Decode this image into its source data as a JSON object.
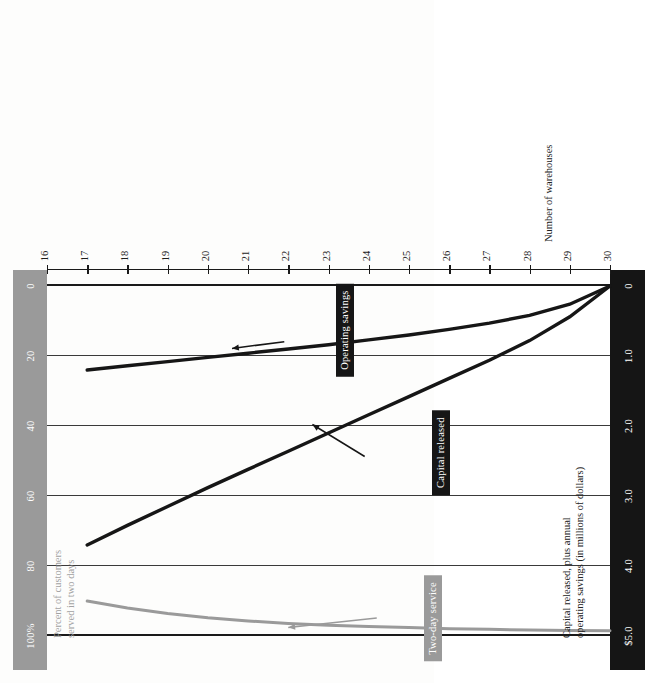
{
  "figure": {
    "orientation": "rotated-90-ccw",
    "colors": {
      "gray": "#9a9a9a",
      "black": "#161616",
      "grid": "#2b2b2b",
      "paper": "#fdfdfc"
    }
  },
  "axis_left_title_line1": "Capital released, plus annual",
  "axis_left_title_line2": "operating savings (in millions of dollars)",
  "axis_right_title_line1": "Percent of customers",
  "axis_right_title_line2": "served in two days",
  "axis_x_title": "Number of warehouses",
  "ticks_dollars": [
    "$5.0",
    "4.0",
    "3.0",
    "2.0",
    "1.0",
    "0"
  ],
  "ticks_percent": [
    "100%",
    "80",
    "60",
    "40",
    "20",
    "0"
  ],
  "ticks_warehouses": [
    "16",
    "17",
    "18",
    "19",
    "20",
    "21",
    "22",
    "23",
    "24",
    "25",
    "26",
    "27",
    "28",
    "29",
    "30"
  ],
  "series_labels": {
    "two_day_service": "Two-day service",
    "capital_released": "Capital released",
    "operating_savings": "Operating savings"
  },
  "chart_data": {
    "type": "line",
    "title": "",
    "xlabel": "Number of warehouses",
    "ylabel": "Capital released, plus annual operating savings (in millions of dollars)",
    "y2label": "Percent of customers served in two days",
    "xlim": [
      16,
      30
    ],
    "ylim": [
      0,
      5.0
    ],
    "y2lim": [
      0,
      100
    ],
    "grid": true,
    "legend": "inline-callouts",
    "x": [
      16,
      17,
      18,
      19,
      20,
      21,
      22,
      23,
      24,
      25,
      26,
      27,
      28,
      29,
      30
    ],
    "series": [
      {
        "name": "Two-day service",
        "axis": "y2",
        "units": "percent of customers served in two days",
        "color": "#9a9a9a",
        "values": [
          null,
          90.0,
          92.0,
          93.6,
          94.8,
          95.7,
          96.4,
          96.9,
          97.3,
          97.6,
          97.9,
          98.1,
          98.3,
          98.4,
          98.5
        ]
      },
      {
        "name": "Capital released",
        "axis": "y1",
        "units": "millions of dollars",
        "color": "#161616",
        "values": [
          null,
          3.7,
          3.42,
          3.15,
          2.88,
          2.62,
          2.36,
          2.1,
          1.84,
          1.58,
          1.32,
          1.06,
          0.78,
          0.44,
          0.0
        ]
      },
      {
        "name": "Operating savings",
        "axis": "y1",
        "units": "millions of dollars",
        "color": "#161616",
        "values": [
          null,
          1.2,
          1.14,
          1.08,
          1.02,
          0.96,
          0.9,
          0.84,
          0.77,
          0.7,
          0.62,
          0.53,
          0.42,
          0.26,
          0.0
        ]
      }
    ],
    "annotations": [
      {
        "text": "Two-day service",
        "points_to_series": "Two-day service",
        "style": "gray-box-with-arrow"
      },
      {
        "text": "Capital released",
        "points_to_series": "Capital released",
        "style": "black-box-with-arrow"
      },
      {
        "text": "Operating savings",
        "points_to_series": "Operating savings",
        "style": "black-box-with-arrow"
      }
    ]
  }
}
